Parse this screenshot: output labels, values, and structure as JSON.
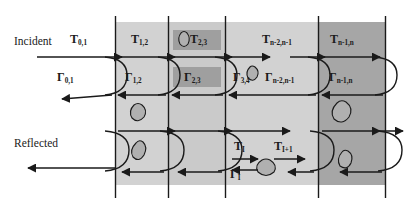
{
  "figure": {
    "type": "schematic-diagram",
    "width": 407,
    "height": 201
  },
  "colors": {
    "background": "#ffffff",
    "line": "#1a1a1a",
    "layer_light": "#d2d2d2",
    "layer_mid": "#c2c2c2",
    "layer_dark": "#a6a6a6",
    "highlight_box": "#9f9f9f",
    "blob_fill": "#b0b0b0"
  },
  "side_labels": {
    "incident": "Incident",
    "reflected": "Reflected"
  },
  "transmission": [
    {
      "label": "T",
      "sub": "0,1"
    },
    {
      "label": "T",
      "sub": "1,2"
    },
    {
      "label": "T",
      "sub": "2,3"
    },
    {
      "label": "T",
      "sub": "n-2,n-1"
    },
    {
      "label": "T",
      "sub": "n-1,n"
    }
  ],
  "reflection": [
    {
      "label": "Γ",
      "sub": "0,1"
    },
    {
      "label": "Γ",
      "sub": "1,2"
    },
    {
      "label": "Γ",
      "sub": "2,3"
    },
    {
      "label": "Γ",
      "sub": "3,4"
    },
    {
      "label": "Γ",
      "sub": "n-2,n-1"
    },
    {
      "label": "Γ",
      "sub": "n-1,n"
    }
  ],
  "inner_pair": {
    "t_in": {
      "label": "T",
      "sub": "I"
    },
    "t_out": {
      "label": "T",
      "sub": "I+1"
    },
    "gamma": {
      "label": "Γ",
      "sub": "I"
    }
  },
  "layers": [
    {
      "name": "layer-1",
      "x": 115,
      "width": 53,
      "shade": "#d2d2d2"
    },
    {
      "name": "layer-2",
      "x": 168,
      "width": 57,
      "shade": "#cacaca"
    },
    {
      "name": "layer-3",
      "x": 225,
      "width": 93,
      "shade": "#d2d2d2"
    },
    {
      "name": "layer-4",
      "x": 318,
      "width": 67,
      "shade": "#a6a6a6"
    }
  ],
  "boundaries_x": [
    115,
    168,
    225,
    318,
    385
  ],
  "band": {
    "top": 22,
    "bottom": 185
  }
}
